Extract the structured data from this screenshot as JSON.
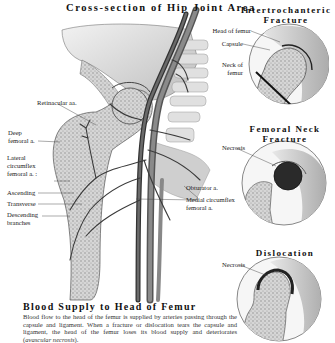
{
  "main_illustration": {
    "title": "Cross-section of Hip Joint Area",
    "labels": {
      "retinacular": "Retinacular aa.",
      "deep_femoral_1": "Deep",
      "deep_femoral_2": "femoral a.",
      "lateral_1": "Lateral",
      "lateral_2": "circumflex",
      "lateral_3": "femoral a. :",
      "ascending": "Ascending",
      "transverse": "Transverse",
      "descending_1": "Descending",
      "descending_2": "branches",
      "obturator": "Obturator a.",
      "medial_1": "Medial circumflex",
      "medial_2": "femoral a."
    }
  },
  "panels": [
    {
      "title_line1": "Intertrochanteric",
      "title_line2": "Fracture",
      "labels": {
        "head": "Head of femur",
        "capsule": "Capsule",
        "neck_1": "Neck of",
        "neck_2": "femur"
      }
    },
    {
      "title_line1": "Femoral Neck",
      "title_line2": "Fracture",
      "labels": {
        "necrosis": "Necrosis"
      }
    },
    {
      "title_line1": "Dislocation",
      "labels": {
        "necrosis": "Necrosis"
      }
    }
  ],
  "blood_supply": {
    "title": "Blood Supply to Head of Femur",
    "text_main": "Blood flow to the head of the femur is supplied by arteries passing through the capsule and ligament.  When a fracture or dislocation tears the capsule and ligament, the head of the femur loses its blood supply and deteriorates (",
    "text_italic": "avascular necrosis",
    "text_end": ")."
  },
  "colors": {
    "ink": "#222222",
    "bone_fill": "#cfcfcf",
    "artery": "#3a3a3a",
    "necrosis": "#2a2a2a"
  }
}
